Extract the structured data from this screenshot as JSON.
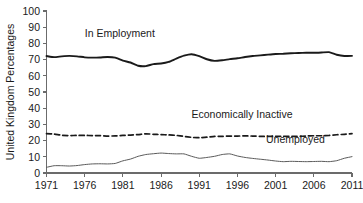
{
  "chart_data": {
    "type": "line",
    "title": "",
    "xlabel": "",
    "ylabel": "United Kingdom Percentages",
    "xlim": [
      1971,
      2011
    ],
    "ylim": [
      0,
      100
    ],
    "grid": false,
    "legend_position": "inline-labels",
    "x_ticks": [
      "1971",
      "1976",
      "1981",
      "1986",
      "1991",
      "1996",
      "2001",
      "2006",
      "2011"
    ],
    "y_ticks": [
      "0",
      "10",
      "20",
      "30",
      "40",
      "50",
      "60",
      "70",
      "80",
      "90",
      "100"
    ],
    "x": [
      1971,
      1972,
      1973,
      1974,
      1975,
      1976,
      1977,
      1978,
      1979,
      1980,
      1981,
      1982,
      1983,
      1984,
      1985,
      1986,
      1987,
      1988,
      1989,
      1990,
      1991,
      1992,
      1993,
      1994,
      1995,
      1996,
      1997,
      1998,
      1999,
      2000,
      2001,
      2002,
      2003,
      2004,
      2005,
      2006,
      2007,
      2008,
      2009,
      2010,
      2011
    ],
    "series": [
      {
        "name": "In Employment",
        "label": "In Employment",
        "style": "solid-thick",
        "color": "#1a1a1a",
        "values": [
          72.2,
          71.5,
          72.0,
          72.3,
          72.0,
          71.4,
          71.2,
          71.3,
          71.6,
          71.2,
          69.4,
          68.2,
          66.2,
          66.0,
          67.2,
          67.6,
          68.6,
          70.6,
          72.4,
          73.3,
          72.1,
          70.2,
          69.2,
          69.6,
          70.3,
          70.8,
          71.6,
          72.2,
          72.6,
          73.1,
          73.5,
          73.6,
          73.9,
          74.1,
          74.2,
          74.2,
          74.4,
          74.6,
          73.0,
          72.2,
          72.3
        ]
      },
      {
        "name": "Economically Inactive",
        "label": "Economically Inactive",
        "style": "dashed",
        "color": "#1a1a1a",
        "values": [
          24.3,
          24.0,
          23.3,
          23.1,
          23.2,
          23.2,
          23.1,
          23.1,
          22.8,
          22.9,
          23.2,
          23.4,
          23.7,
          24.2,
          23.9,
          23.7,
          23.5,
          23.2,
          22.6,
          22.0,
          21.8,
          22.1,
          22.6,
          22.6,
          22.8,
          22.8,
          22.9,
          22.8,
          22.6,
          22.6,
          22.6,
          22.7,
          22.6,
          22.6,
          22.8,
          23.0,
          23.0,
          23.2,
          23.6,
          23.9,
          24.3
        ]
      },
      {
        "name": "Unemployed",
        "label": "Unemployed",
        "style": "solid-thin",
        "color": "#5a5a5a",
        "values": [
          3.5,
          4.5,
          4.5,
          4.3,
          4.6,
          5.2,
          5.6,
          5.7,
          5.6,
          5.9,
          7.5,
          8.6,
          10.3,
          11.4,
          11.9,
          12.3,
          12.0,
          11.8,
          11.8,
          10.3,
          9.1,
          9.6,
          10.3,
          11.4,
          11.8,
          10.5,
          9.6,
          9.0,
          8.5,
          8.0,
          7.4,
          7.0,
          7.2,
          7.1,
          7.0,
          7.1,
          7.2,
          7.0,
          7.6,
          9.1,
          10.1
        ]
      }
    ],
    "annotations": [
      {
        "text": "In Employment",
        "x": 1980.6,
        "y": 84
      },
      {
        "text": "Economically Inactive",
        "x": 1996.6,
        "y": 34
      },
      {
        "text": "Unemployed",
        "x": 2003.6,
        "y": 18.5
      }
    ]
  },
  "footnote": {
    "text": ""
  }
}
